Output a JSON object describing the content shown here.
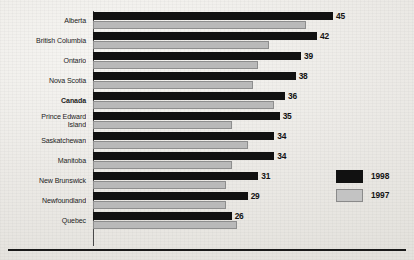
{
  "chart_data": {
    "type": "bar",
    "orientation": "horizontal",
    "title": "",
    "subtitle": "",
    "xlabel": "",
    "ylabel": "",
    "grid": false,
    "legend_position": "right",
    "xlim": [
      0,
      45
    ],
    "categories": [
      "Alberta",
      "British Columbia",
      "Ontario",
      "Nova Scotia",
      "Canada",
      "Prince Edward\nIsland",
      "Saskatchewan",
      "Manitoba",
      "New Brunswick",
      "Newfoundland",
      "Quebec"
    ],
    "emphasized_category": "Canada",
    "series": [
      {
        "name": "1998",
        "color": "#111111",
        "values": [
          45,
          42,
          39,
          38,
          36,
          35,
          34,
          34,
          31,
          29,
          26
        ],
        "labels": [
          "45",
          "42",
          "39",
          "38",
          "36",
          "35",
          "34",
          "34",
          "31",
          "29",
          "26"
        ]
      },
      {
        "name": "1997",
        "color": "#b9b9b9",
        "values": [
          40,
          33,
          31,
          30,
          34,
          26,
          29,
          26,
          25,
          25,
          27
        ],
        "labels": [
          "",
          "",
          "",
          "",
          "",
          "",
          "",
          "",
          "",
          "",
          ""
        ]
      }
    ]
  },
  "legend": {
    "items": [
      {
        "label": "1998",
        "swatch": "black"
      },
      {
        "label": "1997",
        "swatch": "gray"
      }
    ]
  }
}
